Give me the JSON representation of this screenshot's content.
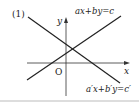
{
  "figure": {
    "label": "(1)",
    "axes": {
      "x_label": "x",
      "y_label": "y",
      "origin_label": "O"
    },
    "lines": [
      {
        "name": "line-1",
        "equation": "ax+by=c",
        "x1": 27,
        "y1": 80,
        "x2": 121,
        "y2": 16
      },
      {
        "name": "line-2",
        "equation": "a′x+b′y=c′",
        "x1": 28,
        "y1": 17,
        "x2": 120,
        "y2": 83
      }
    ],
    "colors": {
      "stroke": "#222222",
      "rule": "#bbbbbb"
    }
  }
}
